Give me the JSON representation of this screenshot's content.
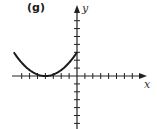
{
  "panel": {
    "label": "(g)"
  },
  "chart_data": {
    "type": "line",
    "title": "(g)",
    "xlabel": "x",
    "ylabel": "y",
    "function": "y = (3/16)(x + 4)^2",
    "x": [
      -8,
      -7,
      -6,
      -5,
      -4,
      -3,
      -2,
      -1,
      0
    ],
    "values": [
      3,
      1.6875,
      0.75,
      0.1875,
      0,
      0.1875,
      0.75,
      1.6875,
      3
    ],
    "xlim": [
      -8,
      9
    ],
    "ylim": [
      -6,
      8
    ],
    "ticks": {
      "x_step": 1,
      "y_step": 1,
      "x_tick_labels": [],
      "y_tick_labels": []
    },
    "grid": false,
    "legend": null,
    "annotations": [
      "vertex at (-4, 0)",
      "y-intercept at (0, 3)"
    ]
  },
  "axes": {
    "x_label": "x",
    "y_label": "y"
  },
  "colors": {
    "curve": "#1a1a1a",
    "axes": "#222222"
  }
}
